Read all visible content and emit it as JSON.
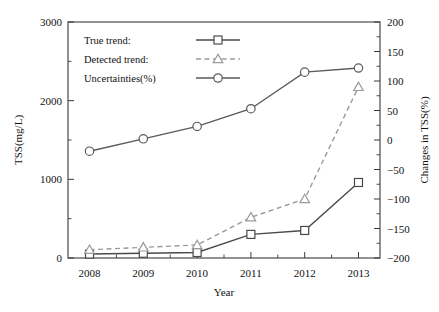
{
  "chart_data": {
    "type": "line",
    "title": "",
    "xlabel": "Year",
    "ylabel": "TSS(mg/L)",
    "y2label": "Changes in TSS(%)",
    "categories": [
      "2008",
      "2009",
      "2010",
      "2011",
      "2012",
      "2013"
    ],
    "x": [
      2008,
      2009,
      2010,
      2011,
      2012,
      2013
    ],
    "xlim": [
      2007.6,
      2013.4
    ],
    "ylim": [
      0,
      3000
    ],
    "y2lim": [
      -200,
      200
    ],
    "yticks": [
      0,
      1000,
      2000,
      3000
    ],
    "yticklabels": [
      "0",
      "1000",
      "2000",
      "3000"
    ],
    "yminorticks": [
      500,
      1500,
      2500
    ],
    "y2ticks": [
      -200,
      -150,
      -100,
      -50,
      0,
      50,
      100,
      150,
      200
    ],
    "y2ticklabels": [
      "−200",
      "−150",
      "−100",
      "−50",
      "0",
      "50",
      "100",
      "150",
      "200"
    ],
    "xticks": [
      2008,
      2009,
      2010,
      2011,
      2012,
      2013
    ],
    "xminorticks": [
      2008.5,
      2009.5,
      2010.5,
      2011.5,
      2012.5
    ],
    "grid": false,
    "legend_position": "upper-left",
    "series": [
      {
        "name": "True trend:",
        "axis": "left",
        "marker": "square",
        "linestyle": "solid",
        "color": "#4a4a4a",
        "values": [
          50,
          60,
          70,
          300,
          350,
          960
        ]
      },
      {
        "name": "Detected trend:",
        "axis": "right",
        "marker": "triangle",
        "linestyle": "dashed",
        "color": "#9a9a9a",
        "values": [
          -186,
          -182,
          -178,
          -131,
          -100,
          90
        ]
      },
      {
        "name": "Uncertainties(%)",
        "axis": "right",
        "marker": "circle",
        "linestyle": "solid",
        "color": "#5a5a5a",
        "values": [
          -19,
          2,
          23,
          53,
          115,
          122
        ]
      }
    ]
  },
  "legend": {
    "items": [
      {
        "label": "True trend:",
        "marker": "square-marker",
        "style": "solid"
      },
      {
        "label": "Detected trend:",
        "marker": "triangle-marker",
        "style": "dashed"
      },
      {
        "label": "Uncertainties(%)",
        "marker": "circle-marker",
        "style": "solid"
      }
    ]
  },
  "axes": {
    "left_title": "TSS(mg/L)",
    "right_title": "Changes in TSS(%)",
    "bottom_title": "Year"
  },
  "colors": {
    "true_trend": "#4a4a4a",
    "detected_trend": "#9a9a9a",
    "uncertainties": "#5a5a5a",
    "frame": "#3a3a3a",
    "background": "#ffffff"
  }
}
